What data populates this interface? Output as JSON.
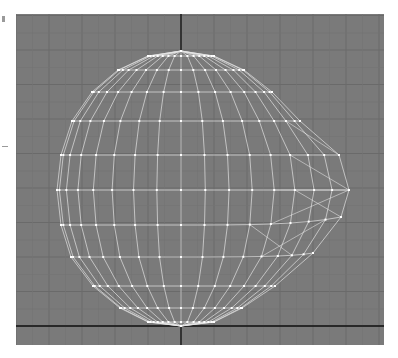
{
  "viewport": {
    "name": "Front",
    "background_color": "#7a7a7a",
    "grid_color": "#6a6a6a",
    "axis_color": "#111111",
    "wire_color": "#e6e6e6",
    "vertex_color": "#ffffff"
  },
  "object": {
    "type": "sphere",
    "display": "wireframe",
    "segments_visible": 16,
    "rows": 13,
    "deformation": "right-side pull toward +X near equator"
  }
}
